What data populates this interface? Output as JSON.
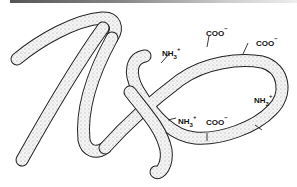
{
  "figure": {
    "labels": [
      {
        "id": "nh3_upper_left",
        "base": "NH",
        "sub": "3",
        "sup": "+"
      },
      {
        "id": "coo_top",
        "base": "COO",
        "sub": "",
        "sup": "−"
      },
      {
        "id": "coo_top_right",
        "base": "COO",
        "sub": "",
        "sup": "−"
      },
      {
        "id": "nh3_right",
        "base": "NH",
        "sub": "3",
        "sup": "+"
      },
      {
        "id": "nh3_bottom",
        "base": "NH",
        "sub": "3",
        "sup": "+"
      },
      {
        "id": "coo_bottom",
        "base": "COO",
        "sub": "",
        "sup": "−"
      }
    ]
  },
  "colors": {
    "outline": "#222222",
    "fill": "#d8d8d8",
    "top_bar": "#666666"
  }
}
